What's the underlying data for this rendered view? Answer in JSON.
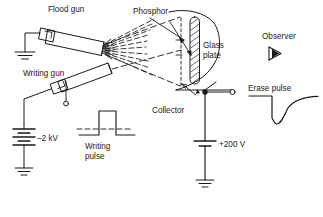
{
  "figure": {
    "kind": "schematic-diagram",
    "line_color": "#1a1a1a",
    "background": "#ffffff"
  },
  "labels": {
    "flood_gun": "Flood gun",
    "writing_gun": "Writing gun",
    "phosphor": "Phosphor",
    "glass_plate_line1": "Glass",
    "glass_plate_line2": "plate",
    "collector": "Collector",
    "observer": "Observer",
    "erase_pulse": "Erase pulse",
    "writing_pulse_line1": "Writing",
    "writing_pulse_line2": "pulse",
    "supply_negative": "–2 kV",
    "supply_positive": "+200 V"
  },
  "icons": {
    "ground_flood": "ground-icon",
    "ground_negative_supply": "ground-icon",
    "ground_positive_supply": "ground-icon",
    "observer_eye": "observer-eye-icon",
    "battery_negative": "battery-multicell-icon",
    "battery_positive": "battery-cell-icon",
    "node_filled": "junction-dot-icon",
    "node_open": "open-terminal-icon",
    "electron_fan": "electron-beam-fan-icon",
    "writing_beam": "electron-beam-dashed-icon",
    "glass_plate_hatch": "hatched-plate-icon",
    "tube_envelope": "crt-envelope-icon"
  },
  "waveforms": {
    "writing_pulse": {
      "type": "square-positive-pulse",
      "baseline": "dashed",
      "description": "rectangular positive-going pulse on a dashed baseline"
    },
    "erase_pulse": {
      "type": "negative-spike-exponential-recovery",
      "baseline": "solid",
      "description": "sharp negative-going spike returning exponentially to baseline"
    }
  }
}
